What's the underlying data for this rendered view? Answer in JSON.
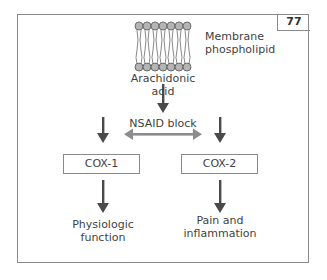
{
  "figure": {
    "number": "77",
    "labels": {
      "membrane": "Membrane phospholipid",
      "membrane_line1": "Membrane",
      "membrane_line2": "phospholipid",
      "arachidonic": "Arachidonic acid",
      "nsaid": "NSAID block",
      "cox1": "COX-1",
      "cox2": "COX-2",
      "physio_line1": "Physiologic",
      "physio_line2": "function",
      "pain_line1": "Pain and",
      "pain_line2": "inflammation"
    },
    "colors": {
      "arrow": "#4a4a4a",
      "block_arrow": "#8c8c8c",
      "lipid_head": "#b5b5b5",
      "border": "#8a8a8a"
    }
  }
}
